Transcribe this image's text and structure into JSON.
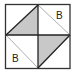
{
  "diagram": {
    "type": "square-quadrant-figure",
    "colors": {
      "line": "#222222",
      "shade": "#c8c8c8",
      "background": "#ffffff",
      "thin_line": "#888888"
    },
    "labels": [
      {
        "text": "B",
        "quadrant": "top-right"
      },
      {
        "text": "B",
        "quadrant": "bottom-left"
      }
    ],
    "quadrants": [
      {
        "position": "top-left",
        "shaded_triangle": "lower-right",
        "diagonal": "bottom-left-to-top-right"
      },
      {
        "position": "top-right",
        "shaded_triangle": "none",
        "diagonal": "top-left-to-bottom-right"
      },
      {
        "position": "bottom-left",
        "shaded_triangle": "none",
        "diagonal": "top-left-to-bottom-right"
      },
      {
        "position": "bottom-right",
        "shaded_triangle": "upper-left",
        "diagonal": "bottom-left-to-top-right"
      }
    ]
  }
}
